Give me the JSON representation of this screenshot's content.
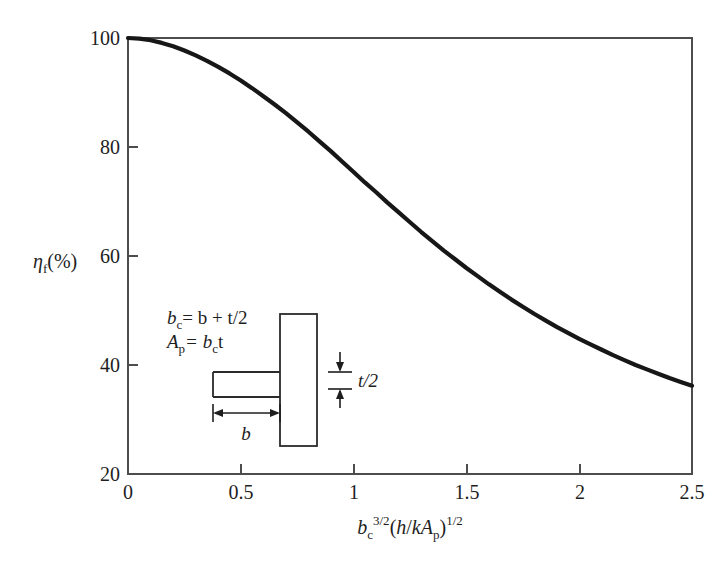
{
  "figure": {
    "background_color": "#ffffff",
    "curve_color": "#171717",
    "axis_color": "#4d4d4d"
  },
  "axes": {
    "x": {
      "title_parts": {
        "base": "b",
        "base_sub": "c",
        "base_sup": "3/2",
        "paren_open": "(",
        "h": "h",
        "slash": "/",
        "k": "k",
        "A": "A",
        "A_sub": "p",
        "paren_close": ")",
        "paren_sup": "1/2"
      },
      "title_plain": "b_c^{3/2}(h/kA_p)^{1/2}",
      "ticks": [
        "0",
        "0.5",
        "1",
        "1.5",
        "2",
        "2.5"
      ],
      "min": 0,
      "max": 2.5
    },
    "y": {
      "title_parts": {
        "eta": "η",
        "eta_sub": "f",
        "unit": "(%)"
      },
      "title_plain": "η_f(%)",
      "ticks": [
        "20",
        "40",
        "60",
        "80",
        "100"
      ],
      "min": 20,
      "max": 100
    }
  },
  "inset": {
    "equation_1": {
      "lhs": "b",
      "lhs_sub": "c",
      "eq": "= b + t/2"
    },
    "equation_2": {
      "lhs": "A",
      "lhs_sub": "p",
      "eq": "= b",
      "eq_sub": "c",
      "eq_tail": "t"
    },
    "equation_1_plain": "b_c = b + t/2",
    "equation_2_plain": "A_p = b_c t",
    "label_thickness": "t/2",
    "label_width": "b"
  },
  "chart_data": {
    "type": "line",
    "title": "",
    "xlabel": "b_c^{3/2}(h/kA_p)^{1/2}",
    "ylabel": "η_f(%)",
    "xlim": [
      0,
      2.5
    ],
    "ylim": [
      20,
      100
    ],
    "grid": false,
    "legend": "none",
    "xticks": [
      0,
      0.5,
      1,
      1.5,
      2,
      2.5
    ],
    "yticks": [
      20,
      40,
      60,
      80,
      100
    ],
    "series": [
      {
        "name": "straight fin efficiency",
        "x": [
          0.0,
          0.05,
          0.1,
          0.15,
          0.2,
          0.25,
          0.3,
          0.35,
          0.4,
          0.45,
          0.5,
          0.55,
          0.6,
          0.65,
          0.7,
          0.75,
          0.8,
          0.85,
          0.9,
          0.95,
          1.0,
          1.05,
          1.1,
          1.15,
          1.2,
          1.25,
          1.3,
          1.35,
          1.4,
          1.45,
          1.5,
          1.55,
          1.6,
          1.65,
          1.7,
          1.75,
          1.8,
          1.85,
          1.9,
          1.95,
          2.0,
          2.05,
          2.1,
          2.15,
          2.2,
          2.25,
          2.3,
          2.35,
          2.4,
          2.45,
          2.5
        ],
        "y": [
          100.0,
          99.9,
          99.6,
          99.1,
          98.5,
          97.7,
          96.8,
          95.8,
          94.7,
          93.5,
          92.2,
          90.8,
          89.3,
          87.8,
          86.2,
          84.5,
          82.8,
          81.0,
          79.2,
          77.3,
          75.4,
          73.5,
          71.7,
          69.8,
          68.0,
          66.2,
          64.4,
          62.7,
          61.0,
          59.4,
          57.8,
          56.3,
          54.8,
          53.4,
          52.0,
          50.7,
          49.4,
          48.2,
          47.0,
          45.9,
          44.8,
          43.8,
          42.8,
          41.8,
          40.9,
          40.0,
          39.2,
          38.4,
          37.6,
          36.9,
          36.2
        ]
      }
    ],
    "notes": [
      "Monotonically decreasing fin efficiency curve",
      "Starts at 100% at x=0, inflection near x=1.0",
      "Reads approximately 93% at x=0.5, 75% at x=1.0, 58% at x=1.5, 45% at x=2.0, 36% at x=2.5"
    ]
  }
}
